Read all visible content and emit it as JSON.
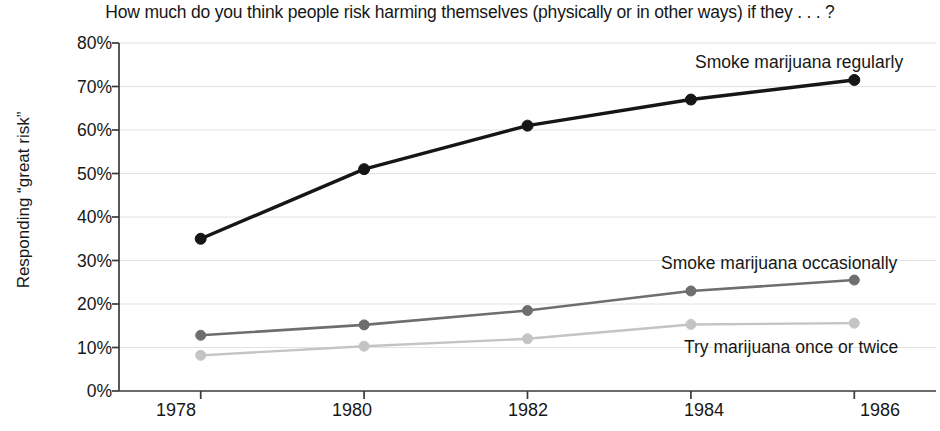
{
  "chart_data": {
    "type": "line",
    "title": "How much do you think people risk harming themselves (physically or in other ways) if they . . . ?",
    "subtitle": "",
    "xlabel": "",
    "ylabel": "Responding “great risk”",
    "x": [
      1978,
      1980,
      1982,
      1984,
      1986
    ],
    "categories": [
      "1978",
      "1980",
      "1982",
      "1984",
      "1986"
    ],
    "xtick_labels": [
      "1978",
      "1980",
      "1982",
      "1984",
      "1986"
    ],
    "ytick_labels": [
      "0%",
      "10%",
      "20%",
      "30%",
      "40%",
      "50%",
      "60%",
      "70%",
      "80%"
    ],
    "ytick_values": [
      0,
      10,
      20,
      30,
      40,
      50,
      60,
      70,
      80
    ],
    "ylim": [
      0,
      80
    ],
    "xlim": [
      1977,
      1987
    ],
    "grid": true,
    "grid_axis": "y",
    "legend": "inline-annotations",
    "legend_position": "right-inline",
    "series": [
      {
        "name": "Smoke marijuana regularly",
        "values": [
          35,
          51,
          61,
          67,
          71.5
        ],
        "color": "#161616",
        "marker": "circle",
        "marker_size": 9,
        "line_width": 3.4,
        "label_x": 1985.0,
        "label_y": 76.5
      },
      {
        "name": "Smoke marijuana occasionally",
        "values": [
          12.8,
          15.2,
          18.5,
          23,
          25.5
        ],
        "color": "#6e6e6e",
        "marker": "circle",
        "marker_size": 8,
        "line_width": 2.6,
        "label_x": 1984.9,
        "label_y": 29.5
      },
      {
        "name": "Try marijuana once or twice",
        "values": [
          8.2,
          10.3,
          12,
          15.3,
          15.6
        ],
        "color": "#c4c4c4",
        "marker": "circle",
        "marker_size": 8,
        "line_width": 2.4,
        "label_x": 1984.6,
        "label_y": 11.2
      }
    ]
  },
  "colors": {
    "background": "#ffffff",
    "text": "#171717",
    "axis": "#3a3a3a",
    "grid": "#e2e2e2",
    "series_regular": "#161616",
    "series_occasional": "#6e6e6e",
    "series_try": "#c4c4c4"
  }
}
